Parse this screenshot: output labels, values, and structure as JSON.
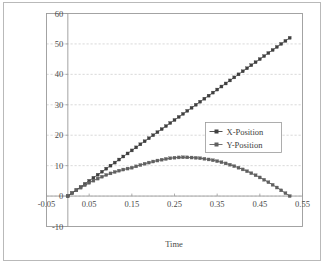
{
  "chart_data": {
    "type": "line",
    "title": "",
    "subtitle": "",
    "xlabel": "Time",
    "ylabel": "",
    "xlim": [
      -0.05,
      0.55
    ],
    "ylim": [
      -10,
      60
    ],
    "xticks": [
      -0.05,
      0.05,
      0.15,
      0.25,
      0.35,
      0.45,
      0.55
    ],
    "xtick_labels": [
      "-0.05",
      "0.05",
      "0.15",
      "0.25",
      "0.35",
      "0.45",
      "0.55"
    ],
    "yticks": [
      -10,
      0,
      10,
      20,
      30,
      40,
      50,
      60
    ],
    "ytick_labels": [
      "-10",
      "0",
      "10",
      "20",
      "30",
      "40",
      "50",
      "60"
    ],
    "grid": "horizontal-dashed",
    "legend_position": "center-right",
    "marker": "square",
    "series": [
      {
        "name": "X-Position",
        "color": "#404040",
        "marker": "square",
        "x": [
          0,
          0.01,
          0.02,
          0.03,
          0.04,
          0.05,
          0.06,
          0.07,
          0.08,
          0.09,
          0.1,
          0.11,
          0.12,
          0.13,
          0.14,
          0.15,
          0.16,
          0.17,
          0.18,
          0.19,
          0.2,
          0.21,
          0.22,
          0.23,
          0.24,
          0.25,
          0.26,
          0.27,
          0.28,
          0.29,
          0.3,
          0.31,
          0.32,
          0.33,
          0.34,
          0.35,
          0.36,
          0.37,
          0.38,
          0.39,
          0.4,
          0.41,
          0.42,
          0.43,
          0.44,
          0.45,
          0.46,
          0.47,
          0.48,
          0.49,
          0.5,
          0.51,
          0.52
        ],
        "values": [
          0,
          1.0,
          2.0,
          3.0,
          4.0,
          5.0,
          6.0,
          7.0,
          8.0,
          9.0,
          10.0,
          11.0,
          12.0,
          13.0,
          14.0,
          15.0,
          16.0,
          17.0,
          18.0,
          19.0,
          20.0,
          21.0,
          22.0,
          23.0,
          24.0,
          25.0,
          26.0,
          27.0,
          28.0,
          29.0,
          30.0,
          31.0,
          32.0,
          33.0,
          34.0,
          35.0,
          36.0,
          37.0,
          38.0,
          39.0,
          40.0,
          41.0,
          42.0,
          43.0,
          44.0,
          45.0,
          46.0,
          47.0,
          48.0,
          49.0,
          50.0,
          51.0,
          52.0
        ]
      },
      {
        "name": "Y-Position",
        "color": "#606060",
        "marker": "square",
        "x": [
          0,
          0.01,
          0.02,
          0.03,
          0.04,
          0.05,
          0.06,
          0.07,
          0.08,
          0.09,
          0.1,
          0.11,
          0.12,
          0.13,
          0.14,
          0.15,
          0.16,
          0.17,
          0.18,
          0.19,
          0.2,
          0.21,
          0.22,
          0.23,
          0.24,
          0.25,
          0.26,
          0.27,
          0.28,
          0.29,
          0.3,
          0.31,
          0.32,
          0.33,
          0.34,
          0.35,
          0.36,
          0.37,
          0.38,
          0.39,
          0.4,
          0.41,
          0.42,
          0.43,
          0.44,
          0.45,
          0.46,
          0.47,
          0.48,
          0.49,
          0.5,
          0.51,
          0.52
        ],
        "values": [
          0,
          0.97,
          1.89,
          2.76,
          3.58,
          4.35,
          5.07,
          5.74,
          6.36,
          6.93,
          7.45,
          7.92,
          8.34,
          8.71,
          9.03,
          9.31,
          9.76,
          10.2,
          10.62,
          11.0,
          11.35,
          11.67,
          11.95,
          12.2,
          12.42,
          12.6,
          12.7,
          12.74,
          12.72,
          12.66,
          12.56,
          12.43,
          12.25,
          12.03,
          11.77,
          11.47,
          11.12,
          10.73,
          10.3,
          9.83,
          9.31,
          8.76,
          8.16,
          7.52,
          6.84,
          6.12,
          5.36,
          4.55,
          3.7,
          2.81,
          1.88,
          0.96,
          0.0
        ]
      }
    ]
  },
  "legend": {
    "entries": [
      {
        "label": "X-Position"
      },
      {
        "label": "Y-Position"
      }
    ]
  },
  "axes": {
    "x_title": "Time"
  }
}
